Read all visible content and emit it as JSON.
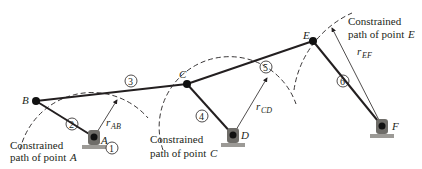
{
  "diagram": {
    "points": {
      "A": {
        "label": "A",
        "x": 94,
        "y": 137
      },
      "B": {
        "label": "B",
        "x": 36,
        "y": 101
      },
      "C": {
        "label": "C",
        "x": 187,
        "y": 84
      },
      "D": {
        "label": "D",
        "x": 233,
        "y": 135
      },
      "E": {
        "label": "E",
        "x": 313,
        "y": 41
      },
      "F": {
        "label": "F",
        "x": 382,
        "y": 126
      }
    },
    "links": [
      {
        "id": "2",
        "label": "2",
        "from": "A",
        "to": "B"
      },
      {
        "id": "3",
        "label": "3",
        "from": "B",
        "to": "E"
      },
      {
        "id": "4",
        "label": "4",
        "from": "C",
        "to": "D"
      },
      {
        "id": "5",
        "label": "5",
        "from": "C",
        "to": "E"
      },
      {
        "id": "6",
        "label": "6",
        "from": "E",
        "to": "F"
      }
    ],
    "ground_label": "1",
    "radii": {
      "AB": {
        "label": "r",
        "sub": "AB"
      },
      "CD": {
        "label": "r",
        "sub": "CD"
      },
      "EF": {
        "label": "r",
        "sub": "EF"
      }
    },
    "captions": {
      "A": {
        "line1": "Constrained",
        "line2": "path of point",
        "point": "A"
      },
      "C": {
        "line1": "Constrained",
        "line2": "path of point",
        "point": "C"
      },
      "E": {
        "line1": "Constrained",
        "line2": "path of point",
        "point": "E"
      }
    },
    "colors": {
      "ink": "#231f20",
      "ground": "#9c9a96",
      "support": "#6f6d69"
    }
  }
}
